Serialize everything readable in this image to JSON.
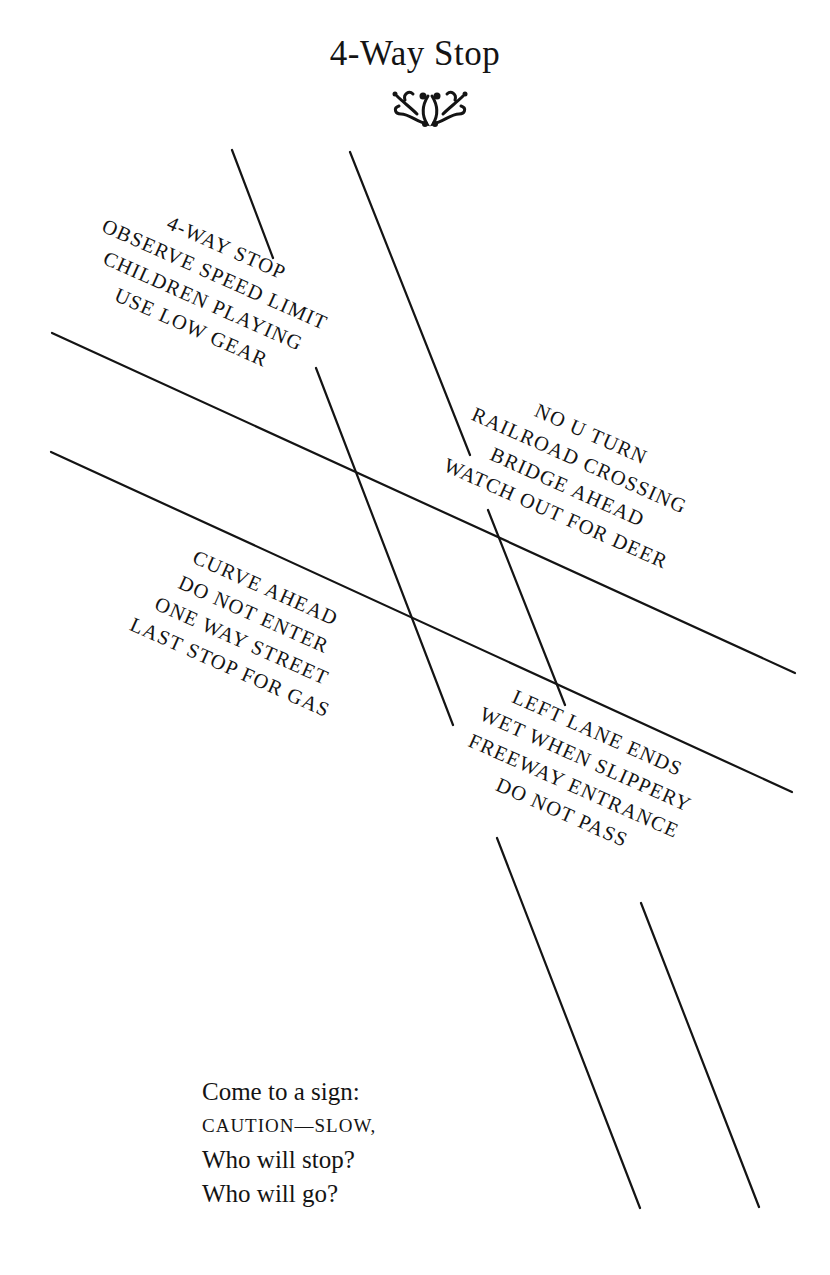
{
  "page": {
    "title": "4-Way Stop",
    "ornament_icon": "fleuron-ornament"
  },
  "sign_groups": {
    "top_left": [
      "4-WAY STOP",
      "OBSERVE SPEED LIMIT",
      "CHILDREN PLAYING",
      "USE LOW GEAR"
    ],
    "top_right": [
      "NO U TURN",
      "RAILROAD CROSSING",
      "BRIDGE AHEAD",
      "WATCH OUT FOR DEER"
    ],
    "bottom_left": [
      "CURVE AHEAD",
      "DO NOT ENTER",
      "ONE WAY STREET",
      "LAST STOP FOR GAS"
    ],
    "bottom_right": [
      "LEFT LANE ENDS",
      "WET WHEN SLIPPERY",
      "FREEWAY ENTRANCE",
      "DO NOT PASS"
    ]
  },
  "poem": {
    "lines": [
      "Come to a sign:",
      "CAUTION—SLOW,",
      "Who will stop?",
      "Who will go?"
    ]
  },
  "colors": {
    "ink": "#141414",
    "paper": "#ffffff"
  }
}
